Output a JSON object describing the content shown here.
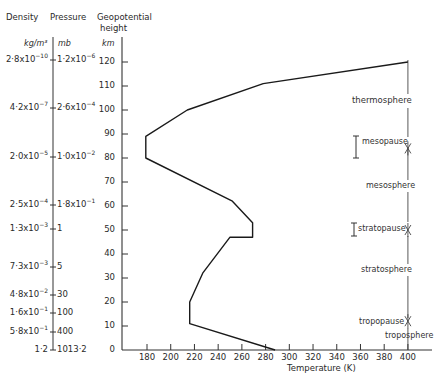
{
  "headers": {
    "density": "Density",
    "pressure": "Pressure",
    "geopotential": "Geopotential",
    "height": "height",
    "density_unit": "kg/m³",
    "pressure_unit": "mb",
    "height_unit": "km"
  },
  "scales": [
    {
      "density_m": "2·8x10",
      "density_e": "−10",
      "pressure_m": "1·2x10",
      "pressure_e": "−6",
      "y": 60
    },
    {
      "density_m": "4·2x10",
      "density_e": "−7",
      "pressure_m": "2·6x10",
      "pressure_e": "−4",
      "y": 108
    },
    {
      "density_m": "2·0x10",
      "density_e": "−5",
      "pressure_m": "1·0x10",
      "pressure_e": "−2",
      "y": 157
    },
    {
      "density_m": "2·5x10",
      "density_e": "−4",
      "pressure_m": "1·8x10",
      "pressure_e": "−1",
      "y": 205
    },
    {
      "density_m": "1·3x10",
      "density_e": "−3",
      "pressure_m": "1",
      "pressure_e": "",
      "y": 229
    },
    {
      "density_m": "7·3x10",
      "density_e": "−3",
      "pressure_m": "5",
      "pressure_e": "",
      "y": 267
    },
    {
      "density_m": "4·8x10",
      "density_e": "−2",
      "pressure_m": "30",
      "pressure_e": "",
      "y": 295
    },
    {
      "density_m": "1·6x10",
      "density_e": "−1",
      "pressure_m": "100",
      "pressure_e": "",
      "y": 313
    },
    {
      "density_m": "5·8x10",
      "density_e": "−1",
      "pressure_m": "400",
      "pressure_e": "",
      "y": 332
    },
    {
      "density_m": "1·2",
      "density_e": "",
      "pressure_m": "1013·2",
      "pressure_e": "",
      "y": 350
    }
  ],
  "layers": [
    {
      "name": "thermosphere",
      "type": "region"
    },
    {
      "name": "mesopause",
      "type": "boundary"
    },
    {
      "name": "mesosphere",
      "type": "region"
    },
    {
      "name": "stratopause",
      "type": "boundary"
    },
    {
      "name": "stratosphere",
      "type": "region"
    },
    {
      "name": "tropopause",
      "type": "boundary"
    },
    {
      "name": "troposphere",
      "type": "region"
    }
  ],
  "chart_data": {
    "type": "line",
    "title": "",
    "xlabel": "Temperature (K)",
    "ylabel": "Geopotential height (km)",
    "x_ticks": [
      180,
      200,
      220,
      240,
      260,
      280,
      300,
      320,
      340,
      360,
      380,
      400
    ],
    "y_ticks": [
      0,
      10,
      20,
      30,
      40,
      50,
      60,
      70,
      80,
      90,
      100,
      110,
      120
    ],
    "xlim": [
      170,
      420
    ],
    "ylim": [
      0,
      125
    ],
    "grid": false,
    "series": [
      {
        "name": "Temperature profile",
        "x": [
          288,
          216,
          216,
          227,
          250,
          269,
          269,
          252,
          179,
          179,
          214,
          278,
          400
        ],
        "y": [
          0,
          11,
          20,
          32,
          47,
          47,
          53,
          62,
          80,
          89,
          100,
          111,
          120
        ]
      }
    ],
    "secondary_axes": {
      "density_kg_m3": [
        "1·2",
        "5·8x10^-1",
        "1·6x10^-1",
        "4·8x10^-2",
        "7·3x10^-3",
        "1·3x10^-3",
        "2·5x10^-4",
        "2·0x10^-5",
        "4·2x10^-7",
        "2·8x10^-10"
      ],
      "pressure_mb": [
        "1013·2",
        "400",
        "100",
        "30",
        "5",
        "1",
        "1·8x10^-1",
        "1·0x10^-2",
        "2·6x10^-4",
        "1·2x10^-6"
      ]
    },
    "annotations": [
      {
        "text": "thermosphere",
        "height_km": 115
      },
      {
        "text": "mesopause",
        "height_km": 84,
        "range_km": [
          80,
          89
        ]
      },
      {
        "text": "mesosphere",
        "height_km": 68
      },
      {
        "text": "stratopause",
        "height_km": 50,
        "range_km": [
          47,
          53
        ]
      },
      {
        "text": "stratosphere",
        "height_km": 32
      },
      {
        "text": "tropopause",
        "height_km": 12
      },
      {
        "text": "troposphere",
        "height_km": 5
      }
    ]
  }
}
